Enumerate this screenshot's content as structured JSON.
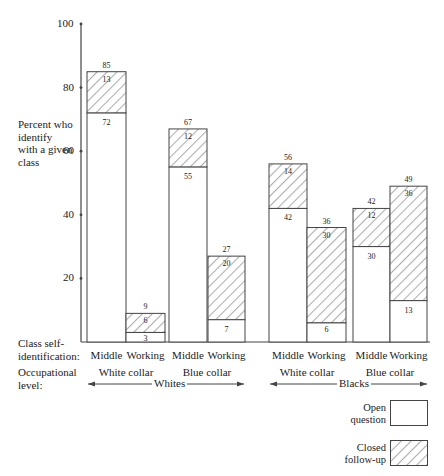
{
  "chart_data": {
    "type": "bar",
    "stacked": true,
    "title": "",
    "ylabel": "Percent who identify with a given class",
    "ylim": [
      0,
      100
    ],
    "yticks": [
      20,
      40,
      60,
      80,
      100
    ],
    "categories": [
      {
        "race": "Whites",
        "occupation": "White collar",
        "class": "Middle"
      },
      {
        "race": "Whites",
        "occupation": "White collar",
        "class": "Working"
      },
      {
        "race": "Whites",
        "occupation": "Blue collar",
        "class": "Middle"
      },
      {
        "race": "Whites",
        "occupation": "Blue collar",
        "class": "Working"
      },
      {
        "race": "Blacks",
        "occupation": "White collar",
        "class": "Middle"
      },
      {
        "race": "Blacks",
        "occupation": "White collar",
        "class": "Working"
      },
      {
        "race": "Blacks",
        "occupation": "Blue collar",
        "class": "Middle"
      },
      {
        "race": "Blacks",
        "occupation": "Blue collar",
        "class": "Working"
      }
    ],
    "series": [
      {
        "name": "Open question",
        "pattern": "plain",
        "values": [
          72,
          3,
          55,
          7,
          42,
          6,
          30,
          13
        ]
      },
      {
        "name": "Closed follow-up",
        "pattern": "hatched",
        "values": [
          13,
          6,
          12,
          20,
          14,
          30,
          12,
          36
        ]
      }
    ],
    "totals": [
      85,
      9,
      67,
      27,
      56,
      36,
      42,
      49
    ],
    "legend": {
      "position": "bottom-right",
      "entries": [
        "Open question",
        "Closed follow-up"
      ]
    }
  },
  "labels": {
    "ylabel_lines": [
      "Percent who",
      "identify",
      "with a given",
      "class"
    ],
    "row1_lines": [
      "Class self-",
      "identification:"
    ],
    "row2_lines": [
      "Occupational",
      "level:"
    ],
    "classes": [
      "Middle",
      "Working",
      "Middle",
      "Working",
      "Middle",
      "Working",
      "Middle",
      "Working"
    ],
    "occupations": [
      "White collar",
      "Blue collar",
      "White collar",
      "Blue collar"
    ],
    "races": [
      "Whites",
      "Blacks"
    ],
    "legend_open": [
      "Open",
      "question"
    ],
    "legend_closed": [
      "Closed",
      "follow-up"
    ]
  },
  "colors": {
    "line": "#444444",
    "hatch": "#b0b0b0",
    "background": "#ffffff"
  }
}
